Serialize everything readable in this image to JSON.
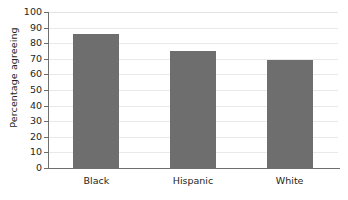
{
  "chart_data": {
    "type": "bar",
    "title": "",
    "xlabel": "",
    "ylabel": "Percentage agreeing",
    "categories": [
      "Black",
      "Hispanic",
      "White"
    ],
    "values": [
      86,
      75,
      69
    ],
    "ylim": [
      0,
      100
    ],
    "ytick_step": 10,
    "yticks": [
      100,
      90,
      80,
      70,
      60,
      50,
      40,
      30,
      20,
      10,
      0
    ],
    "ytick_labels": [
      "100",
      "90",
      "80",
      "70",
      "60",
      "50",
      "40",
      "30",
      "20",
      "10",
      "0"
    ],
    "grid": true,
    "legend": false,
    "bar_color": "#6e6e6e",
    "axis_color": "#6d6e71",
    "grid_color": "#e9e9ea",
    "background": "#ffffff"
  }
}
